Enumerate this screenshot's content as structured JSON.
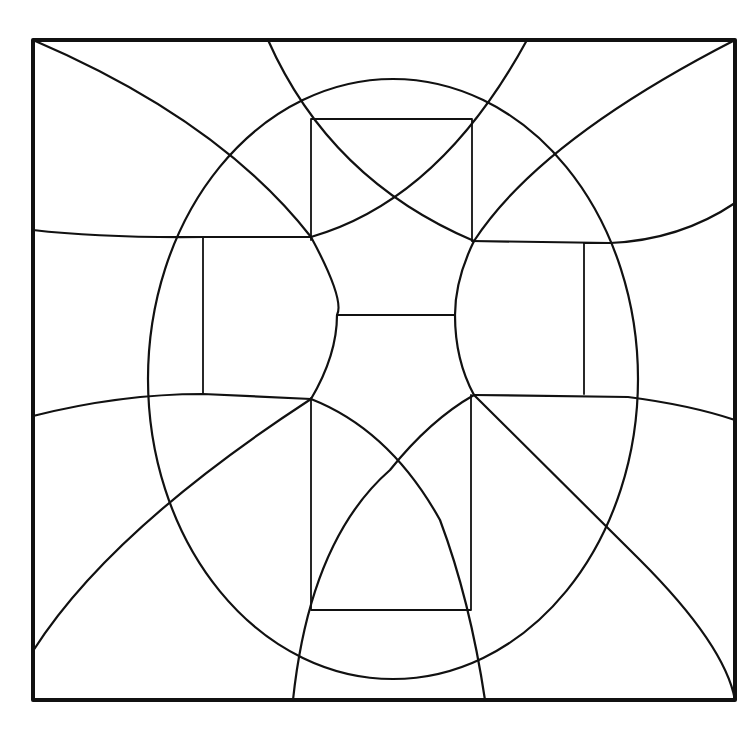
{
  "figure": {
    "stroke_color": "#111111",
    "background": "#ffffff",
    "frame": {
      "x1": 33,
      "y1": 40,
      "x2": 735,
      "y2": 700
    },
    "ellipse": {
      "cx": 393,
      "cy": 379,
      "rx": 245,
      "ry": 300
    },
    "rectangles": [
      {
        "name": "top",
        "x1": 311,
        "y1": 119,
        "x2": 472,
        "y2": 240
      },
      {
        "name": "bottom",
        "x1": 311,
        "y1": 397,
        "x2": 471,
        "y2": 610
      },
      {
        "name": "left",
        "x1": 203,
        "y1": 237,
        "x2": 311,
        "y2": 394
      },
      {
        "name": "right",
        "x1": 472,
        "y1": 242,
        "x2": 584,
        "y2": 395
      }
    ],
    "center_bar": {
      "x1": 337,
      "y1": 315,
      "x2": 455,
      "y2": 315
    }
  }
}
